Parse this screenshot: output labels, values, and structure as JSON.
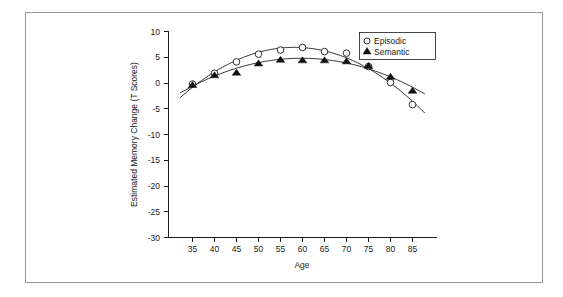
{
  "chart_data": {
    "type": "scatter",
    "title": "",
    "xlabel": "Age",
    "ylabel": "Estimated Memory Change (T Scores)",
    "xlim": [
      32,
      88
    ],
    "ylim": [
      -30,
      10
    ],
    "xticks": [
      "35",
      "40",
      "45",
      "50",
      "55",
      "60",
      "65",
      "70",
      "75",
      "80",
      "85"
    ],
    "xtick_values": [
      35,
      40,
      45,
      50,
      55,
      60,
      65,
      70,
      75,
      80,
      85
    ],
    "yticks": [
      "10",
      "5",
      "0",
      "-5",
      "-10",
      "-15",
      "-20",
      "-25",
      "-30"
    ],
    "ytick_values": [
      10,
      5,
      0,
      -5,
      -10,
      -15,
      -20,
      -25,
      -30
    ],
    "grid": false,
    "legend_position": "top-right",
    "x": [
      35,
      40,
      45,
      50,
      55,
      60,
      65,
      70,
      75,
      80,
      85
    ],
    "series": [
      {
        "name": "Episodic",
        "marker": "open-circle",
        "values": [
          -0.2,
          1.9,
          4.1,
          5.6,
          6.4,
          6.9,
          6.1,
          5.8,
          3.2,
          0.1,
          -4.2
        ],
        "fit_label": "quadratic-fit"
      },
      {
        "name": "Semantic",
        "marker": "filled-triangle",
        "values": [
          -0.3,
          1.6,
          2.1,
          3.9,
          4.6,
          4.5,
          4.5,
          4.3,
          3.4,
          1.3,
          -1.4
        ],
        "fit_label": "quadratic-fit"
      }
    ],
    "legend": [
      {
        "label": "Episodic",
        "marker": "open-circle"
      },
      {
        "label": "Semantic",
        "marker": "filled-triangle"
      }
    ],
    "colors": {
      "axis": "#1a1a1a",
      "curve": "#1a1a1a",
      "marker_fill_open": "#ffffff",
      "marker_fill_solid": "#111111",
      "frame": "#9a9a9a",
      "background": "#ffffff"
    }
  }
}
